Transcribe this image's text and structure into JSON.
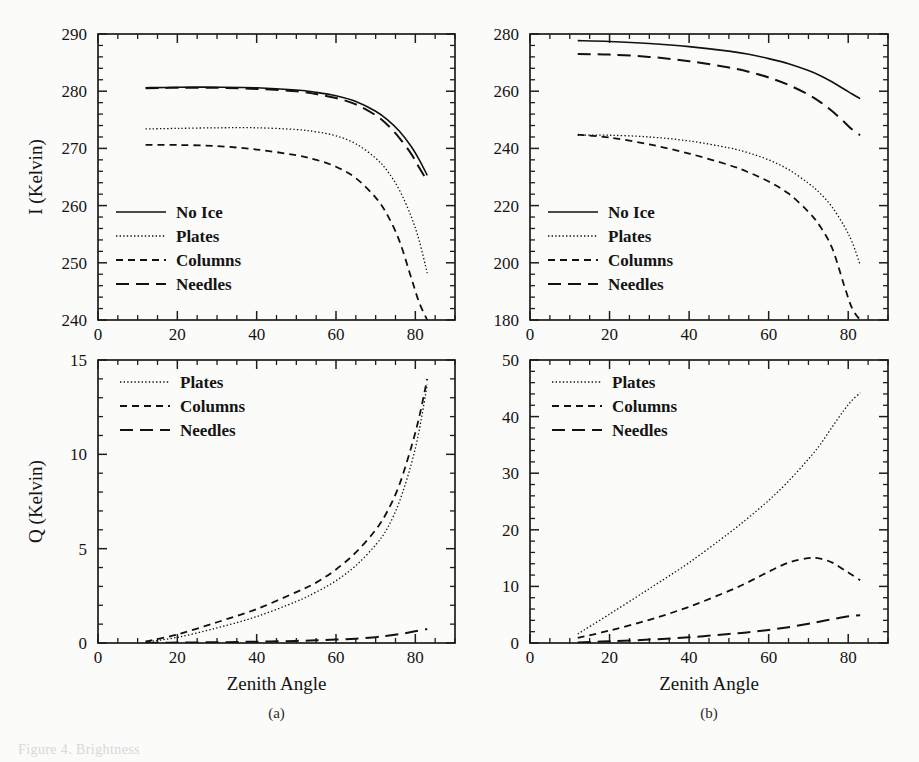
{
  "figure": {
    "panel_labels": [
      "(a)",
      "(b)"
    ],
    "xlabel": "Zenith Angle",
    "ylabel_top": "I (Kelvin)",
    "ylabel_bottom": "Q (Kelvin)",
    "caption_fragment": "Figure 4.  Brightness"
  },
  "legend_full": [
    {
      "label": "No Ice",
      "style": "solid"
    },
    {
      "label": "Plates",
      "style": "dotted"
    },
    {
      "label": "Columns",
      "style": "short-dash"
    },
    {
      "label": "Needles",
      "style": "long-dash"
    }
  ],
  "legend_q": [
    {
      "label": "Plates",
      "style": "dotted"
    },
    {
      "label": "Columns",
      "style": "short-dash"
    },
    {
      "label": "Needles",
      "style": "long-dash"
    }
  ],
  "chart_data": [
    {
      "id": "panel-a-I",
      "type": "line",
      "title": "",
      "xlabel": "Zenith Angle",
      "ylabel": "I (Kelvin)",
      "xlim": [
        0,
        90
      ],
      "ylim": [
        240,
        290
      ],
      "xticks": [
        0,
        20,
        40,
        60,
        80
      ],
      "xtick_labels": [
        "0",
        "20",
        "40",
        "60",
        "80"
      ],
      "xtick_minor_step": 5,
      "yticks": [
        240,
        250,
        260,
        270,
        280,
        290
      ],
      "ytick_labels": [
        "240",
        "250",
        "260",
        "270",
        "280",
        "290"
      ],
      "ytick_minor_step": 2,
      "grid": false,
      "legend_position": "lower-left",
      "x": [
        12,
        20,
        30,
        40,
        50,
        55,
        60,
        65,
        70,
        73,
        76,
        79,
        81,
        83
      ],
      "series": [
        {
          "name": "No Ice",
          "style": "solid",
          "values": [
            280.6,
            280.7,
            280.7,
            280.6,
            280.2,
            279.8,
            279.2,
            278.2,
            276.5,
            275.0,
            273.0,
            270.3,
            268.0,
            265.3
          ]
        },
        {
          "name": "Plates",
          "style": "dotted",
          "values": [
            273.4,
            273.5,
            273.6,
            273.6,
            273.3,
            272.9,
            272.2,
            270.8,
            268.3,
            266.0,
            262.7,
            258.0,
            253.8,
            248.2
          ]
        },
        {
          "name": "Columns",
          "style": "short-dash",
          "values": [
            270.6,
            270.6,
            270.4,
            269.8,
            268.8,
            268.0,
            266.8,
            264.8,
            261.4,
            258.3,
            253.8,
            247.3,
            243.0,
            240.0
          ]
        },
        {
          "name": "Needles",
          "style": "long-dash",
          "values": [
            280.5,
            280.6,
            280.6,
            280.4,
            280.0,
            279.5,
            278.8,
            277.7,
            275.8,
            274.1,
            271.8,
            269.0,
            266.6,
            264.3
          ]
        }
      ]
    },
    {
      "id": "panel-b-I",
      "type": "line",
      "title": "",
      "xlabel": "Zenith Angle",
      "ylabel": "I (Kelvin)",
      "xlim": [
        0,
        90
      ],
      "ylim": [
        180,
        280
      ],
      "xticks": [
        0,
        20,
        40,
        60,
        80
      ],
      "xtick_labels": [
        "0",
        "20",
        "40",
        "60",
        "80"
      ],
      "xtick_minor_step": 5,
      "yticks": [
        180,
        200,
        220,
        240,
        260,
        280
      ],
      "ytick_labels": [
        "180",
        "200",
        "220",
        "240",
        "260",
        "280"
      ],
      "ytick_minor_step": 4,
      "grid": false,
      "legend_position": "lower-left",
      "x": [
        12,
        20,
        30,
        40,
        50,
        55,
        60,
        65,
        70,
        73,
        76,
        79,
        81,
        83
      ],
      "series": [
        {
          "name": "No Ice",
          "style": "solid",
          "values": [
            277.7,
            277.4,
            276.7,
            275.6,
            274.0,
            272.9,
            271.4,
            269.6,
            267.2,
            265.4,
            263.2,
            260.7,
            259.0,
            257.4
          ]
        },
        {
          "name": "Plates",
          "style": "dotted",
          "values": [
            244.6,
            244.6,
            244.0,
            242.6,
            240.2,
            238.4,
            236.0,
            232.6,
            227.8,
            224.2,
            219.4,
            212.8,
            207.2,
            199.3
          ]
        },
        {
          "name": "Columns",
          "style": "short-dash",
          "values": [
            244.8,
            243.8,
            241.4,
            238.2,
            234.2,
            231.6,
            228.4,
            224.2,
            217.8,
            212.6,
            205.0,
            192.0,
            184.0,
            180.0
          ]
        },
        {
          "name": "Needles",
          "style": "long-dash",
          "values": [
            273.0,
            272.8,
            272.0,
            270.5,
            268.3,
            266.8,
            264.8,
            262.2,
            258.8,
            256.2,
            253.0,
            249.2,
            246.6,
            244.6
          ]
        }
      ]
    },
    {
      "id": "panel-a-Q",
      "type": "line",
      "title": "",
      "xlabel": "Zenith Angle",
      "ylabel": "Q (Kelvin)",
      "xlim": [
        0,
        90
      ],
      "ylim": [
        0,
        15
      ],
      "xticks": [
        0,
        20,
        40,
        60,
        80
      ],
      "xtick_labels": [
        "0",
        "20",
        "40",
        "60",
        "80"
      ],
      "xtick_minor_step": 5,
      "yticks": [
        0,
        5,
        10,
        15
      ],
      "ytick_labels": [
        "0",
        "5",
        "10",
        "15"
      ],
      "ytick_minor_step": 1,
      "grid": false,
      "legend_position": "upper-left",
      "x": [
        12,
        20,
        30,
        40,
        50,
        55,
        60,
        65,
        70,
        73,
        76,
        79,
        81,
        83
      ],
      "series": [
        {
          "name": "Plates",
          "style": "dotted",
          "values": [
            0.05,
            0.3,
            0.8,
            1.4,
            2.2,
            2.7,
            3.3,
            4.1,
            5.2,
            6.1,
            7.5,
            9.5,
            11.3,
            13.7
          ]
        },
        {
          "name": "Columns",
          "style": "short-dash",
          "values": [
            0.08,
            0.45,
            1.1,
            1.8,
            2.7,
            3.2,
            3.9,
            4.8,
            6.0,
            7.0,
            8.4,
            10.4,
            12.0,
            14.0
          ]
        },
        {
          "name": "Needles",
          "style": "long-dash",
          "values": [
            0.0,
            0.02,
            0.04,
            0.07,
            0.11,
            0.14,
            0.18,
            0.23,
            0.31,
            0.38,
            0.47,
            0.58,
            0.66,
            0.74
          ]
        }
      ]
    },
    {
      "id": "panel-b-Q",
      "type": "line",
      "title": "",
      "xlabel": "Zenith Angle",
      "ylabel": "Q (Kelvin)",
      "xlim": [
        0,
        90
      ],
      "ylim": [
        0,
        50
      ],
      "xticks": [
        0,
        20,
        40,
        60,
        80
      ],
      "xtick_labels": [
        "0",
        "20",
        "40",
        "60",
        "80"
      ],
      "xtick_minor_step": 5,
      "yticks": [
        0,
        10,
        20,
        30,
        40,
        50
      ],
      "ytick_labels": [
        "0",
        "10",
        "20",
        "30",
        "40",
        "50"
      ],
      "ytick_minor_step": 2,
      "grid": false,
      "legend_position": "upper-left",
      "x": [
        12,
        20,
        30,
        40,
        50,
        55,
        60,
        65,
        70,
        73,
        76,
        79,
        81,
        83
      ],
      "series": [
        {
          "name": "Plates",
          "style": "dotted",
          "values": [
            1.6,
            5.1,
            9.6,
            14.2,
            19.4,
            22.2,
            25.2,
            28.6,
            32.5,
            35.1,
            38.2,
            41.2,
            42.9,
            44.2
          ]
        },
        {
          "name": "Columns",
          "style": "short-dash",
          "values": [
            0.9,
            2.2,
            4.1,
            6.4,
            9.2,
            10.8,
            12.6,
            14.2,
            15.0,
            14.9,
            14.2,
            12.9,
            12.0,
            11.1
          ]
        },
        {
          "name": "Needles",
          "style": "long-dash",
          "values": [
            0.1,
            0.3,
            0.6,
            1.0,
            1.6,
            1.9,
            2.3,
            2.8,
            3.4,
            3.8,
            4.2,
            4.6,
            4.8,
            4.9
          ]
        }
      ]
    }
  ]
}
